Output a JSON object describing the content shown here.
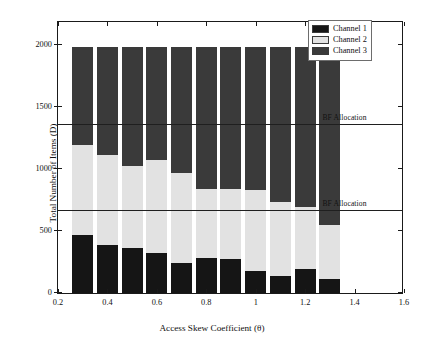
{
  "chart_data": {
    "type": "bar",
    "stacked": true,
    "title": "",
    "xlabel": "Access Skew Coefficient (θ)",
    "ylabel": "Total Number of Items (D)",
    "xlim": [
      0.2,
      1.6
    ],
    "ylim": [
      0,
      2200
    ],
    "grid": false,
    "legend_position": "top-right",
    "xticks": [
      "0.2",
      "0.4",
      "0.6",
      "0.8",
      "1",
      "1.2",
      "1.4",
      "1.6"
    ],
    "xtick_values": [
      0.2,
      0.4,
      0.6,
      0.8,
      1.0,
      1.2,
      1.4,
      1.6
    ],
    "yticks": [
      "0",
      "500",
      "1000",
      "1500",
      "2000"
    ],
    "ytick_values": [
      0,
      500,
      1000,
      1500,
      2000
    ],
    "categories": [
      0.3,
      0.4,
      0.5,
      0.6,
      0.7,
      0.8,
      0.9,
      1.0,
      1.1,
      1.2,
      1.3
    ],
    "bar_width": 0.085,
    "series": [
      {
        "name": "Channel 1",
        "color": "#151515",
        "values": [
          470,
          385,
          365,
          320,
          240,
          280,
          275,
          175,
          140,
          195,
          110
        ]
      },
      {
        "name": "Channel 2",
        "color": "#e2e2e2",
        "values": [
          720,
          730,
          660,
          755,
          730,
          555,
          560,
          655,
          590,
          495,
          435
        ]
      },
      {
        "name": "Channel 3",
        "color": "#3a3a3a",
        "values": [
          795,
          870,
          960,
          910,
          1015,
          1150,
          1150,
          1155,
          1255,
          1295,
          1440
        ]
      }
    ],
    "totals": [
      1985,
      1985,
      1985,
      1985,
      1985,
      1985,
      1985,
      1985,
      1985,
      1985,
      1985
    ],
    "reference_lines": [
      {
        "label": "BF Allocation",
        "value": 1350,
        "label_x": 1.27
      },
      {
        "label": "BF Allocation",
        "value": 660,
        "label_x": 1.27
      }
    ]
  },
  "legend": {
    "items": [
      {
        "label": "Channel 1",
        "color": "#151515"
      },
      {
        "label": "Channel 2",
        "color": "#e2e2e2"
      },
      {
        "label": "Channel 3",
        "color": "#3a3a3a"
      }
    ]
  },
  "axes": {
    "x_title": "Access Skew Coefficient (θ)",
    "y_title": "Total Number of Items (D)"
  }
}
